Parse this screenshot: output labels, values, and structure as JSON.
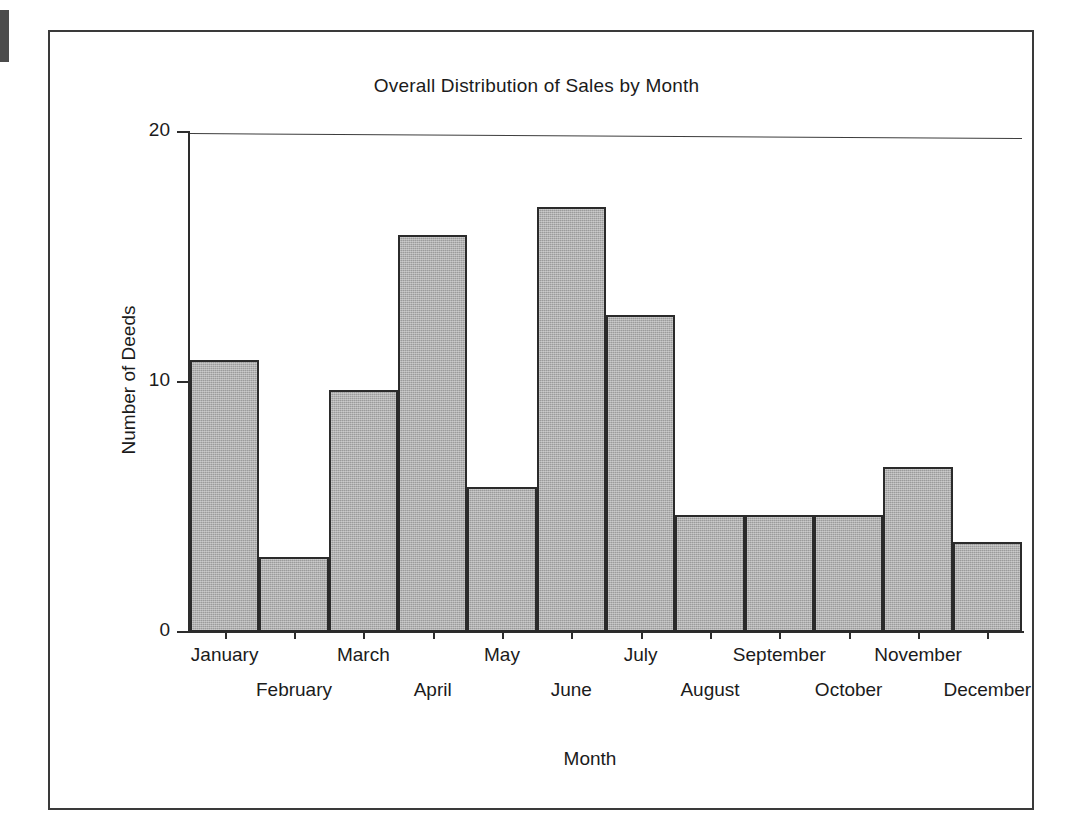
{
  "figure": {
    "frame_color": "#3a3a3a",
    "background": "#ffffff"
  },
  "chart_data": {
    "type": "bar",
    "title": "Overall Distribution of Sales by Month",
    "xlabel": "Month",
    "ylabel": "Number of Deeds",
    "categories": [
      "January",
      "February",
      "March",
      "April",
      "May",
      "June",
      "July",
      "August",
      "September",
      "October",
      "November",
      "December"
    ],
    "values": [
      10.9,
      3.0,
      9.7,
      15.9,
      5.8,
      17.0,
      12.7,
      4.7,
      4.7,
      4.7,
      6.6,
      3.6
    ],
    "ylim": [
      0,
      20
    ],
    "ytick_labels": [
      "0",
      "10",
      "20"
    ],
    "ytick_values": [
      0,
      10,
      20
    ],
    "grid": false,
    "legend": "none",
    "bar_fill_color": "#9b9b9b",
    "bar_edge_color": "#2b2b2b",
    "axis_color": "#2d2d2d",
    "label_row_pattern": [
      "top",
      "bottom",
      "top",
      "bottom",
      "top",
      "bottom",
      "top",
      "bottom",
      "top",
      "bottom",
      "top",
      "bottom"
    ]
  }
}
